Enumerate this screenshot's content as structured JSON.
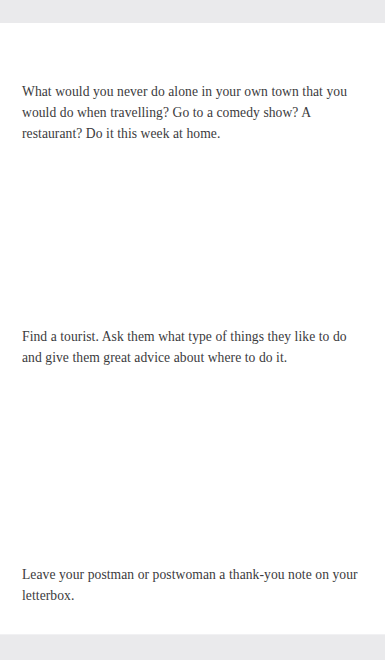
{
  "page": {
    "background_color": "#ffffff",
    "band_color": "#eaeaec",
    "text_color": "#3b3b3d"
  },
  "content": {
    "tips": [
      {
        "id": "tip-comedy-show",
        "text": "What would you never do alone in your own town that you would do when travelling? Go to a comedy show? A restaurant? Do it this week at home."
      },
      {
        "id": "tip-find-a-tourist",
        "text": "Find a tourist. Ask them what type of things they like to do and give them great advice about where to do it."
      },
      {
        "id": "tip-postman-note",
        "text": "Leave your postman or postwoman a thank-you note on your letterbox."
      }
    ]
  }
}
